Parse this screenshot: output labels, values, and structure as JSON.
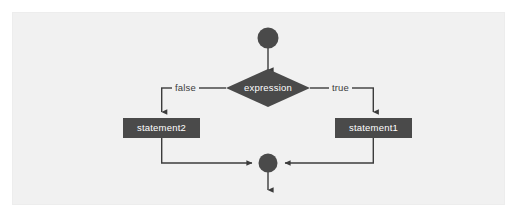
{
  "figure": {
    "canvas": {
      "width": 526,
      "height": 219
    },
    "panel": {
      "background": "#f1f1f1",
      "border": "#ededed"
    },
    "palette": {
      "shape_fill": "#4a4a4a",
      "shape_text": "#ffffff",
      "connector": "#3c3c3c",
      "label_text": "#3c3c3c",
      "page_background": "#ffffff"
    }
  },
  "nodes": {
    "start": {
      "type": "start-node",
      "shape": "circle",
      "label": ""
    },
    "decision": {
      "type": "decision-node",
      "shape": "diamond",
      "label": "expression"
    },
    "false_branch_statement": {
      "type": "process-node",
      "shape": "rectangle",
      "label": "statement2"
    },
    "true_branch_statement": {
      "type": "process-node",
      "shape": "rectangle",
      "label": "statement1"
    },
    "merge": {
      "type": "merge-node",
      "shape": "circle",
      "label": ""
    }
  },
  "edges": {
    "start_to_decision": {
      "label": ""
    },
    "decision_to_false": {
      "label": "false"
    },
    "decision_to_true": {
      "label": "true"
    },
    "false_to_merge": {
      "label": ""
    },
    "true_to_merge": {
      "label": ""
    },
    "merge_to_exit": {
      "label": ""
    }
  }
}
